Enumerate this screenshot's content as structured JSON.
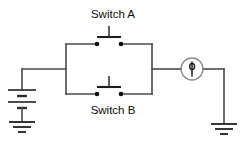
{
  "diagram": {
    "type": "electrical-circuit-schematic",
    "title": "",
    "background_color": "#ffffff",
    "line_color": "#3a3a3a",
    "text_color": "#0d0d0d",
    "width": 245,
    "height": 160
  },
  "labels": {
    "switch_a": "Switch A",
    "switch_b": "Switch B"
  },
  "components": [
    {
      "id": "battery",
      "name": "battery",
      "symbol": "two-cell-battery",
      "label": "",
      "position": {
        "x": 22,
        "y": 97
      }
    },
    {
      "id": "switch-a",
      "name": "switch-a",
      "symbol": "push-button-normally-open",
      "label": "Switch A",
      "position": {
        "x": 109,
        "y": 44
      }
    },
    {
      "id": "switch-b",
      "name": "switch-b",
      "symbol": "push-button-normally-open",
      "label": "Switch B",
      "position": {
        "x": 109,
        "y": 94
      }
    },
    {
      "id": "lamp",
      "name": "lamp",
      "symbol": "lamp-filament-circle",
      "label": "",
      "position": {
        "x": 192,
        "y": 69
      }
    },
    {
      "id": "ground-left",
      "name": "ground-left",
      "symbol": "earth-ground",
      "label": "",
      "position": {
        "x": 22,
        "y": 128
      }
    },
    {
      "id": "ground-right",
      "name": "ground-right",
      "symbol": "earth-ground",
      "label": "",
      "position": {
        "x": 224,
        "y": 130
      }
    }
  ],
  "topology": {
    "description": "Battery feeds a parallel pair of push-button switches (Switch A and Switch B) which then feed a lamp returning to ground.",
    "parallel_branch": [
      "switch-a",
      "switch-b"
    ]
  }
}
